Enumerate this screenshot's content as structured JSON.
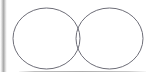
{
  "canvas": {
    "width": 153,
    "height": 81,
    "background_color": "#ffffff",
    "name": "drawing-canvas"
  },
  "chrome": {
    "left_edge": {
      "name": "left-panel-edge",
      "x": 0,
      "y": 0,
      "width": 7,
      "height": 72,
      "color": "#a8a8a8"
    },
    "bottom_divider": {
      "name": "bottom-divider-line",
      "x": 19,
      "y": 71,
      "width": 127,
      "height": 1,
      "color": "#8c8c8c"
    }
  },
  "diagram": {
    "type": "venn",
    "set_count": 2,
    "stroke_color": "#6e6e78",
    "stroke_width": 1,
    "fill": "none",
    "shapes": [
      {
        "name": "left-ellipse",
        "cx": 46.5,
        "cy": 38.5,
        "rx": 33.5,
        "ry": 30.5,
        "label": ""
      },
      {
        "name": "right-ellipse",
        "cx": 109.5,
        "cy": 38.5,
        "rx": 33.5,
        "ry": 30.5,
        "label": ""
      }
    ],
    "intersection_points": [
      {
        "x": 78,
        "y": 19
      },
      {
        "x": 78,
        "y": 59
      }
    ],
    "labels": []
  }
}
